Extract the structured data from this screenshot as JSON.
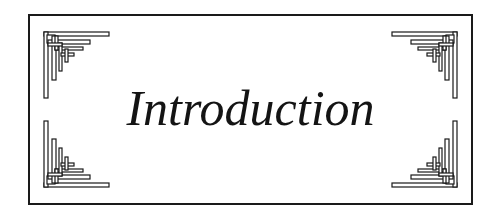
{
  "title": "Introduction",
  "colors": {
    "ink": "#1a1a1a",
    "background": "#ffffff"
  },
  "ornaments": [
    "corner-ornament-top-left",
    "corner-ornament-top-right",
    "corner-ornament-bottom-left",
    "corner-ornament-bottom-right"
  ]
}
